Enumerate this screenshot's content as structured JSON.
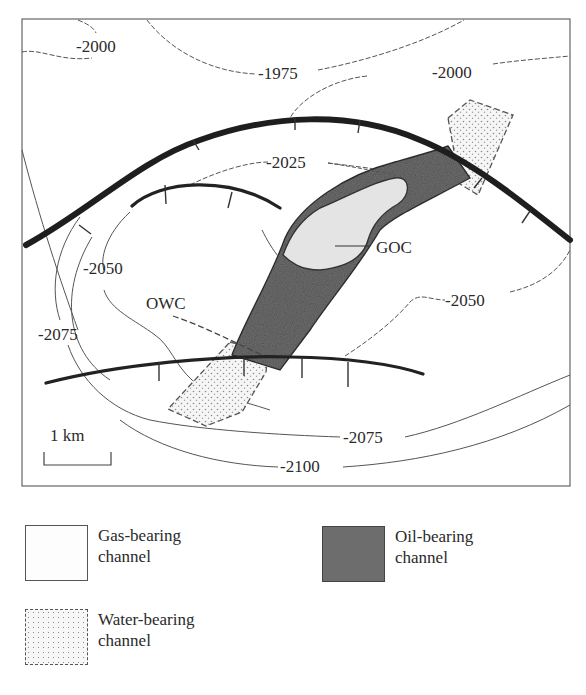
{
  "map": {
    "contour_labels": {
      "c2000_topleft": "-2000",
      "c1975": "-1975",
      "c2000_topright": "-2000",
      "c2025": "-2025",
      "c2050_left": "-2050",
      "c2050_right": "-2050",
      "c2075_left": "-2075",
      "c2075_bottom": "-2075",
      "c2100": "-2100"
    },
    "contacts": {
      "goc": "GOC",
      "owc": "OWC"
    },
    "scale_bar": {
      "label": "1 km"
    },
    "colors": {
      "gas": "#e6e6e6",
      "oil": "#707070",
      "water_dots": "#8a8a8a",
      "fault": "#1e1e1e"
    }
  },
  "legend": {
    "items": [
      {
        "key": "gas",
        "line1": "Gas-bearing",
        "line2": "channel"
      },
      {
        "key": "oil",
        "line1": "Oil-bearing",
        "line2": "channel"
      },
      {
        "key": "water",
        "line1": "Water-bearing",
        "line2": "channel"
      }
    ]
  }
}
